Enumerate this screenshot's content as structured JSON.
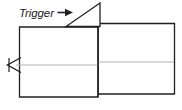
{
  "figure": {
    "type": "line-diagram",
    "title": "",
    "background_color": "#ffffff",
    "stroke_color": "#231f20",
    "centerline_color": "#b3b3b3",
    "annotations": [
      {
        "id": "trigger",
        "label": "Trigger",
        "style": "italic",
        "has_leader_arrow": true,
        "arrow_direction": "right",
        "points_to": "trigger-pointer-triangle"
      }
    ],
    "shapes": [
      {
        "id": "left-body",
        "name": "left-rectangle",
        "x": 19.5,
        "y": 27.0,
        "width": 78.5,
        "height": 70.0
      },
      {
        "id": "right-body",
        "name": "right-rectangle",
        "x": 98.0,
        "y": 23.5,
        "width": 76.5,
        "height": 70.5
      },
      {
        "id": "trigger-pointer-triangle",
        "name": "trigger-pointer-triangle",
        "kind": "triangle",
        "vertices": [
          [
            100.0,
            3.0
          ],
          [
            66.0,
            26.5
          ],
          [
            100.0,
            26.5
          ]
        ]
      },
      {
        "id": "left-arrowhead",
        "name": "left-arrowhead",
        "kind": "open-arrowhead",
        "direction": "left",
        "tip": [
          7.5,
          65.0
        ]
      },
      {
        "id": "centerline-left",
        "name": "centerline-left",
        "kind": "line",
        "from": [
          16.0,
          65.0
        ],
        "to": [
          97.5,
          65.0
        ]
      },
      {
        "id": "centerline-right",
        "name": "centerline-right",
        "kind": "line",
        "from": [
          98.5,
          62.0
        ],
        "to": [
          174.0,
          62.0
        ]
      }
    ]
  }
}
